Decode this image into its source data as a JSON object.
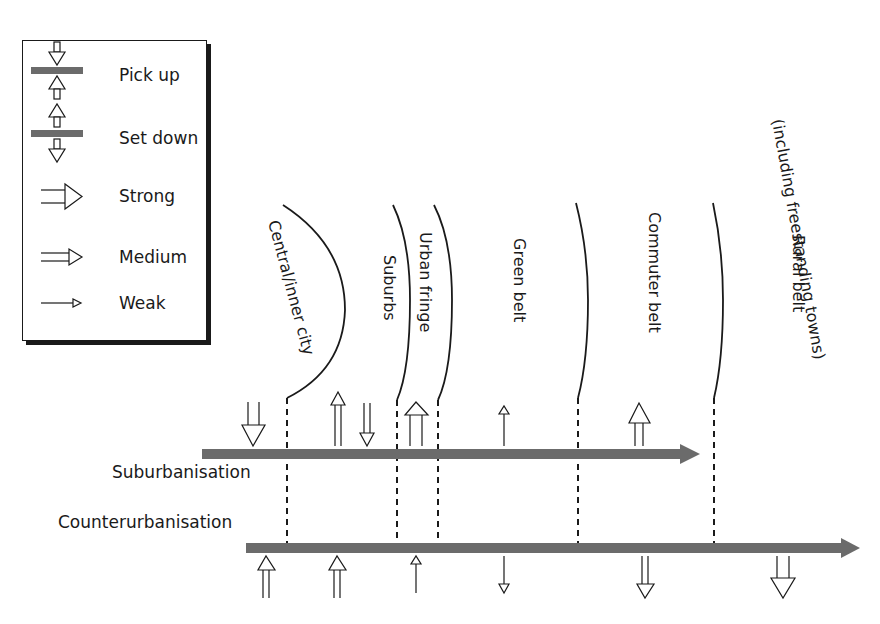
{
  "legend": {
    "items": [
      {
        "key": "pick_up",
        "label": "Pick up"
      },
      {
        "key": "set_down",
        "label": "Set down"
      },
      {
        "key": "strong",
        "label": "Strong"
      },
      {
        "key": "medium",
        "label": "Medium"
      },
      {
        "key": "weak",
        "label": "Weak"
      }
    ]
  },
  "zones": [
    {
      "label": "Central/inner city"
    },
    {
      "label": "Suburbs"
    },
    {
      "label": "Urban fringe"
    },
    {
      "label": "Green belt"
    },
    {
      "label": "Commuter belt"
    },
    {
      "label": "Rural belt"
    },
    {
      "label": "(including freestanding towns)"
    }
  ],
  "processes": {
    "suburbanisation": {
      "label": "Suburbanisation",
      "arrows": [
        {
          "zone": "Central/inner city",
          "type": "pick up",
          "strength": "strong"
        },
        {
          "zone": "Suburbs",
          "type": "set down",
          "strength": "medium"
        },
        {
          "zone": "Suburbs",
          "type": "pick up",
          "strength": "medium"
        },
        {
          "zone": "Urban fringe",
          "type": "set down",
          "strength": "strong"
        },
        {
          "zone": "Green belt",
          "type": "set down",
          "strength": "weak"
        },
        {
          "zone": "Commuter belt",
          "type": "set down",
          "strength": "strong"
        }
      ]
    },
    "counterurbanisation": {
      "label": "Counterurbanisation",
      "arrows": [
        {
          "zone": "Central/inner city",
          "type": "pick up",
          "strength": "medium"
        },
        {
          "zone": "Suburbs",
          "type": "pick up",
          "strength": "medium"
        },
        {
          "zone": "Urban fringe",
          "type": "pick up",
          "strength": "weak"
        },
        {
          "zone": "Green belt",
          "type": "set down",
          "strength": "weak"
        },
        {
          "zone": "Commuter belt",
          "type": "set down",
          "strength": "medium"
        },
        {
          "zone": "Rural belt",
          "type": "set down",
          "strength": "strong"
        }
      ]
    }
  },
  "colors": {
    "bar": "#6b6b6b",
    "line": "#1a1a1a"
  }
}
